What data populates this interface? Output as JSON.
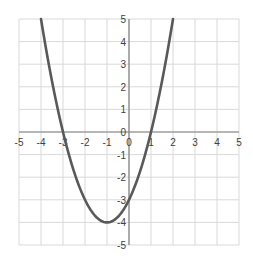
{
  "chart_data": {
    "type": "line",
    "title": "",
    "xlabel": "",
    "ylabel": "",
    "function": "y = x^2 + 2x - 3",
    "xlim": [
      -5,
      5
    ],
    "ylim": [
      -5,
      5
    ],
    "grid": true,
    "legend": "none",
    "x_ticks": [
      "-5",
      "-4",
      "-3",
      "-2",
      "-1",
      "0",
      "1",
      "2",
      "3",
      "4",
      "5"
    ],
    "y_ticks": [
      "5",
      "4",
      "3",
      "2",
      "1",
      "0",
      "-1",
      "-2",
      "-3",
      "-4",
      "-5"
    ],
    "series": [
      {
        "name": "parabola",
        "color": "#595959",
        "x": [
          -4.0,
          -3.5,
          -3.0,
          -2.5,
          -2.0,
          -1.5,
          -1.0,
          -0.5,
          0.0,
          0.5,
          1.0,
          1.5,
          2.0
        ],
        "y": [
          5.0,
          2.25,
          0.0,
          -1.75,
          -3.0,
          -3.75,
          -4.0,
          -3.75,
          -3.0,
          -1.75,
          0.0,
          2.25,
          5.0
        ]
      }
    ],
    "key_points": {
      "roots": [
        -3,
        1
      ],
      "vertex": [
        -1,
        -4
      ],
      "y_intercept": -3
    }
  },
  "colors": {
    "grid": "#d9d9d9",
    "axis": "#808080",
    "curve": "#595959",
    "text": "#404040"
  }
}
